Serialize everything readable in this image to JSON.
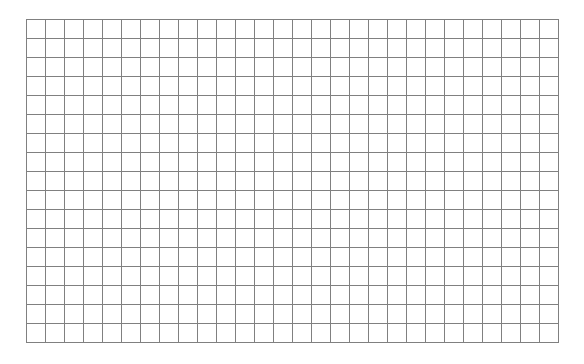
{
  "grid": {
    "columns": 28,
    "rows": 17,
    "cell_width": 19,
    "cell_height": 19,
    "origin_x": 26,
    "origin_y": 19,
    "line_color": "#808080",
    "background_color": "#ffffff"
  }
}
